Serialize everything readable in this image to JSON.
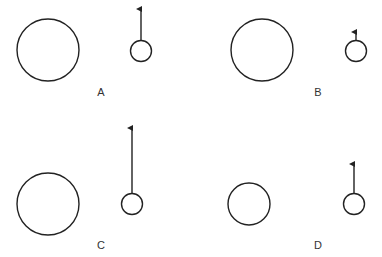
{
  "diagram": {
    "stroke_color": "#222222",
    "panels": [
      {
        "label": "A",
        "big_circle": {
          "cx": 48,
          "cy": 50,
          "r": 31
        },
        "small_circle": {
          "cx": 141,
          "cy": 51,
          "r": 10.5
        },
        "arrow": {
          "y_top": 8,
          "length_desc": "medium"
        },
        "label_pos": {
          "x": 101,
          "y": 96
        }
      },
      {
        "label": "B",
        "big_circle": {
          "cx": 262,
          "cy": 50,
          "r": 31
        },
        "small_circle": {
          "cx": 356,
          "cy": 51,
          "r": 10.5
        },
        "arrow": {
          "y_top": 31,
          "length_desc": "short"
        },
        "label_pos": {
          "x": 318,
          "y": 96
        }
      },
      {
        "label": "C",
        "big_circle": {
          "cx": 48,
          "cy": 204,
          "r": 31
        },
        "small_circle": {
          "cx": 132,
          "cy": 204,
          "r": 10.5
        },
        "arrow": {
          "y_top": 127,
          "length_desc": "long"
        },
        "label_pos": {
          "x": 101,
          "y": 249
        }
      },
      {
        "label": "D",
        "big_circle": {
          "cx": 249,
          "cy": 204,
          "r": 21
        },
        "small_circle": {
          "cx": 354,
          "cy": 204,
          "r": 10.5
        },
        "arrow": {
          "y_top": 163,
          "length_desc": "medium"
        },
        "label_pos": {
          "x": 318,
          "y": 249
        }
      }
    ]
  }
}
